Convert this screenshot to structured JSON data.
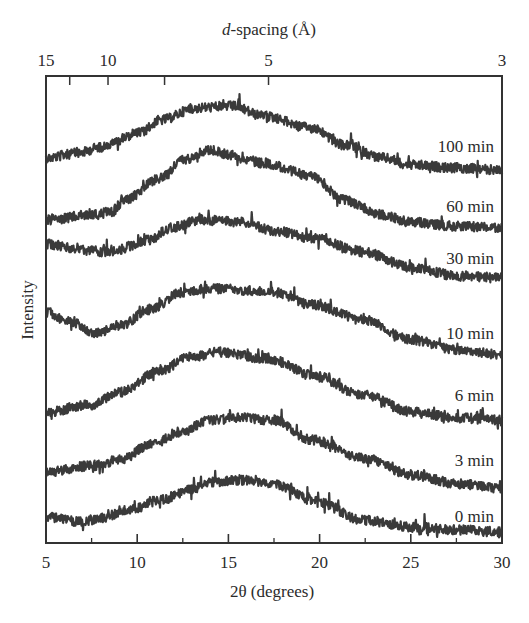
{
  "chart_data": {
    "type": "line",
    "title": "",
    "xlabel": "2θ (degrees)",
    "ylabel": "Intensity",
    "top_xlabel_italic": "d",
    "top_xlabel_rest": "-spacing (Å)",
    "xlim": [
      5,
      30
    ],
    "x_ticks": [
      5,
      10,
      15,
      20,
      25,
      30
    ],
    "x_minor_ticks": [
      7.5,
      12.5,
      17.5,
      22.5,
      27.5
    ],
    "top_axis": {
      "labels": [
        {
          "text": "15",
          "two_theta": 5.0
        },
        {
          "text": "10",
          "two_theta": 8.4
        },
        {
          "text": "5",
          "two_theta": 17.2
        },
        {
          "text": "3",
          "two_theta": 30.0
        }
      ],
      "ticks_two_theta": [
        6.3,
        8.4,
        11.5,
        17.2
      ]
    },
    "grid": false,
    "legend": "inline labels at right end of each trace",
    "y_units": "arbitrary, stacked (offset) traces; values are screen-y of trace center",
    "series": [
      {
        "name": "100 min",
        "label_y": 152,
        "x": [
          5,
          6.8,
          8.0,
          10.1,
          11.3,
          13.2,
          15.2,
          16.9,
          19.6,
          21.3,
          23.5,
          25.0,
          27.5,
          30
        ],
        "y": [
          158,
          153,
          147,
          133,
          120,
          108,
          106,
          116,
          128,
          145,
          158,
          165,
          168,
          170
        ]
      },
      {
        "name": "60 min",
        "label_y": 212,
        "x": [
          5,
          7.5,
          8.6,
          9.3,
          11.3,
          12.5,
          13.9,
          15.2,
          16.9,
          19.6,
          21.3,
          23.5,
          25.0,
          27.5,
          30
        ],
        "y": [
          220,
          215,
          212,
          200,
          178,
          160,
          150,
          155,
          163,
          176,
          200,
          215,
          222,
          226,
          228
        ]
      },
      {
        "name": "30 min",
        "label_y": 264,
        "x": [
          5,
          6.9,
          8.5,
          10.7,
          11.8,
          13.5,
          15.7,
          17.8,
          19.6,
          22.4,
          25.1,
          27.6,
          30
        ],
        "y": [
          244,
          250,
          252,
          240,
          228,
          220,
          222,
          232,
          238,
          252,
          268,
          276,
          278
        ]
      },
      {
        "name": "10 min",
        "label_y": 339,
        "x": [
          5,
          6.3,
          7.7,
          9.1,
          10.7,
          12.4,
          14.0,
          15.7,
          17.4,
          19.6,
          22.4,
          25.1,
          27.6,
          30
        ],
        "y": [
          312,
          322,
          333,
          325,
          310,
          293,
          288,
          290,
          292,
          305,
          320,
          340,
          350,
          355
        ]
      },
      {
        "name": "6 min",
        "label_y": 401,
        "x": [
          5,
          7.4,
          9.1,
          11.3,
          12.9,
          14.6,
          16.8,
          17.4,
          19.6,
          22.4,
          25.1,
          27.6,
          30
        ],
        "y": [
          412,
          405,
          392,
          370,
          357,
          352,
          358,
          360,
          375,
          395,
          412,
          418,
          420
        ]
      },
      {
        "name": "3 min",
        "label_y": 466,
        "x": [
          5,
          7.4,
          9.1,
          10.7,
          12.4,
          14.0,
          15.7,
          17.4,
          19.6,
          22.4,
          25.1,
          27.6,
          30
        ],
        "y": [
          472,
          466,
          460,
          445,
          432,
          420,
          418,
          420,
          440,
          458,
          475,
          484,
          488
        ]
      },
      {
        "name": "0 min",
        "label_y": 522,
        "x": [
          5,
          6.9,
          8.0,
          9.6,
          11.3,
          12.9,
          14.0,
          15.7,
          17.4,
          19.6,
          22.4,
          25.1,
          27.6,
          30
        ],
        "y": [
          517,
          522,
          518,
          510,
          500,
          490,
          482,
          480,
          483,
          500,
          520,
          527,
          530,
          532
        ]
      }
    ],
    "trace_color": "#3a3a3a",
    "noise_amplitude_px": 6
  }
}
